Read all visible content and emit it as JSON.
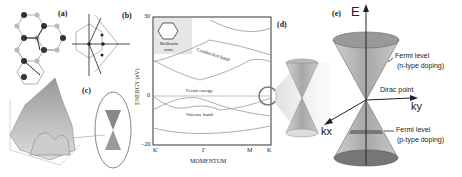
{
  "panels": {
    "a": {
      "label": "(a)",
      "atoms": [
        "A",
        "B"
      ],
      "vectors": [
        "a1",
        "a2",
        "δ1",
        "δ2",
        "δ3"
      ]
    },
    "b": {
      "label": "(b)",
      "axes": [
        "ky",
        "kx"
      ],
      "points": [
        "Γ",
        "K",
        "K'",
        "M"
      ],
      "vectors": [
        "b1",
        "b2"
      ]
    },
    "c": {
      "label": "(c)",
      "axes": [
        "kx",
        "ky",
        "E"
      ]
    },
    "d": {
      "label": "(d)"
    },
    "e": {
      "label": "(e)",
      "axis_e": "E",
      "axis_ky": "ky",
      "axis_kx": "kx",
      "fermi_n": "Fermi level",
      "fermi_n_sub": "(n-type doping)",
      "dirac": "Dirac point",
      "fermi_p": "Fermi level",
      "fermi_p_sub": "(p-type doping)"
    }
  },
  "band_plot": {
    "ylabel": "ENERGY (eV)",
    "xlabel": "MOMENTUM",
    "ytick_top": "30",
    "ytick_zero": "0",
    "ytick_bottom": "−20",
    "xticks": [
      "K'",
      "Γ",
      "M",
      "K"
    ],
    "inset_title": "Brillouin",
    "inset_title2": "zone",
    "inset_points": [
      "K'",
      "•Γ",
      "M",
      "K"
    ],
    "conduction": "Conduction band",
    "fermi": "Fermi energy",
    "valence": "Valence band"
  },
  "colors": {
    "line": "#333333",
    "cone_fill": "#b0b0b0",
    "cone_dark": "#7a7a7a",
    "highlight": "#888888"
  }
}
